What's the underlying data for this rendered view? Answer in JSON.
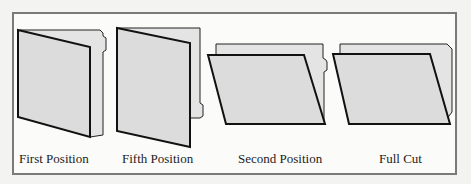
{
  "figure": {
    "background": "#fbfbfa",
    "frame_border_color": "#7a7a7a",
    "folder_fill": "#dcdcdc",
    "folder_back_fill": "#e4e4e4",
    "stroke_color": "#111111",
    "items": [
      {
        "label": "First Position",
        "tab": "first-position"
      },
      {
        "label": "Fifth Position",
        "tab": "fifth-position"
      },
      {
        "label": "Second Position",
        "tab": "second-position"
      },
      {
        "label": "Full Cut",
        "tab": "full-cut"
      }
    ]
  }
}
